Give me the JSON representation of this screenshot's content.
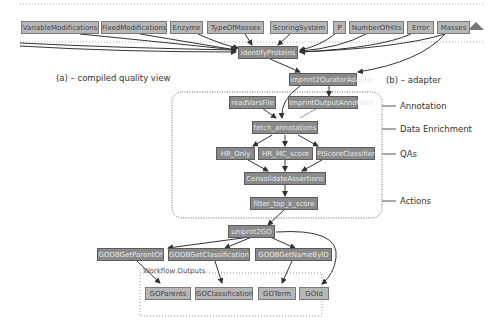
{
  "inputs": [
    "VariableModifications",
    "FixedModifications",
    "Enzyme",
    "TypeOfMasses",
    "ScoringSystem",
    "P",
    "NumberOfHits",
    "Error",
    "Masses"
  ],
  "processors": {
    "identify": "identifyProteins",
    "adapter": "imprint2QuratorAdapter",
    "readVars": "readVarsFile",
    "annotator": "ImprintOutputAnnotator",
    "fetch": "fetch_annotations",
    "hrOnly": "HR_Only",
    "hrMc": "HR_MC_score",
    "classifier": "PIScoreClassifier",
    "consolidate": "ConsolidateAssertions",
    "filter": "filter_top_k_score",
    "uniprot": "uniprot2GO",
    "getParent": "GODBGetParentOf",
    "getClass": "GODBGetClassification",
    "getName": "GODBGetNameByID"
  },
  "outputs": {
    "title": "Workflow Outputs",
    "items": [
      "GOParents",
      "GOClassification",
      "GOTerm",
      "GOId"
    ]
  },
  "annotations": {
    "a": "(a) – compiled quality view",
    "b": "(b) – adapter",
    "layers": [
      "Annotation",
      "Data Enrichment",
      "QAs",
      "Actions"
    ]
  }
}
